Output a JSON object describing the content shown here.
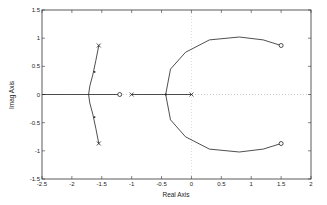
{
  "chart_data": {
    "type": "line",
    "title": "",
    "xlabel": "Real Axis",
    "ylabel": "Imag Axis",
    "xlim": [
      -2.5,
      2
    ],
    "ylim": [
      -1.5,
      1.5
    ],
    "xticks": [
      "-2.5",
      "-2",
      "-1.5",
      "-1",
      "-0.5",
      "0",
      "0.5",
      "1",
      "1.5",
      "2"
    ],
    "yticks": [
      "1.5",
      "1",
      "0.5",
      "0",
      "-0.5",
      "-1",
      "-1.5"
    ],
    "grid": false,
    "poles": [
      {
        "x": -1.55,
        "y": 0.87
      },
      {
        "x": -1.55,
        "y": -0.87
      },
      {
        "x": -1.0,
        "y": 0
      },
      {
        "x": 0.0,
        "y": 0
      }
    ],
    "zeros": [
      {
        "x": -1.2,
        "y": 0
      },
      {
        "x": 1.5,
        "y": 0.87
      },
      {
        "x": 1.5,
        "y": -0.87
      }
    ],
    "branches": [
      {
        "name": "upper-left",
        "points": [
          [
            -1.55,
            0.87
          ],
          [
            -1.6,
            0.6
          ],
          [
            -1.65,
            0.35
          ],
          [
            -1.7,
            0.15
          ],
          [
            -1.72,
            0
          ]
        ]
      },
      {
        "name": "lower-left",
        "points": [
          [
            -1.55,
            -0.87
          ],
          [
            -1.6,
            -0.6
          ],
          [
            -1.65,
            -0.35
          ],
          [
            -1.7,
            -0.15
          ],
          [
            -1.72,
            0
          ]
        ]
      },
      {
        "name": "real-left",
        "points": [
          [
            -2.5,
            0
          ],
          [
            -1.2,
            0
          ]
        ]
      },
      {
        "name": "real-mid",
        "points": [
          [
            -1.0,
            0
          ],
          [
            0.0,
            0
          ]
        ]
      },
      {
        "name": "upper-arc",
        "points": [
          [
            -0.43,
            0
          ],
          [
            -0.35,
            0.45
          ],
          [
            -0.1,
            0.75
          ],
          [
            0.3,
            0.97
          ],
          [
            0.8,
            1.02
          ],
          [
            1.2,
            0.97
          ],
          [
            1.5,
            0.87
          ]
        ]
      },
      {
        "name": "lower-arc",
        "points": [
          [
            -0.43,
            0
          ],
          [
            -0.35,
            -0.45
          ],
          [
            -0.1,
            -0.75
          ],
          [
            0.3,
            -0.97
          ],
          [
            0.8,
            -1.02
          ],
          [
            1.2,
            -0.97
          ],
          [
            1.5,
            -0.87
          ]
        ]
      }
    ],
    "annotations": [
      "breakaway point near -0.43",
      "dotted zero reference lines at x=0 and y=0"
    ]
  }
}
